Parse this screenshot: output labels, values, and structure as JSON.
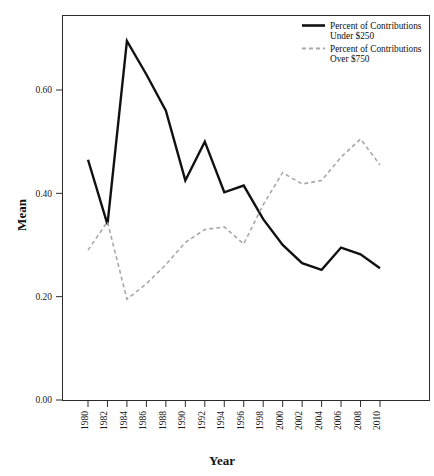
{
  "chart_data": {
    "type": "line",
    "title": "",
    "xlabel": "Year",
    "ylabel": "Mean",
    "x": [
      1980,
      1982,
      1984,
      1986,
      1988,
      1990,
      1992,
      1994,
      1996,
      1998,
      2000,
      2002,
      2004,
      2006,
      2008,
      2010
    ],
    "categories": [
      "1980",
      "1982",
      "1984",
      "1986",
      "1988",
      "1990",
      "1992",
      "1994",
      "1996",
      "1998",
      "2000",
      "2002",
      "2004",
      "2006",
      "2008",
      "2010"
    ],
    "xlim": [
      1980,
      2010
    ],
    "ylim": [
      0.0,
      0.75
    ],
    "ytick_values": [
      0.0,
      0.2,
      0.4,
      0.6
    ],
    "ytick_labels": [
      "0.00",
      "0.20",
      "0.40",
      "0.60"
    ],
    "grid": false,
    "legend_position": "top-right",
    "series": [
      {
        "name": "Percent of Contributions Under $250",
        "name_line1": "Percent of Contributions",
        "name_line2": "Under $250",
        "style": "solid",
        "color": "#111111",
        "width": 2.4,
        "values": [
          0.465,
          0.34,
          0.695,
          0.63,
          0.56,
          0.425,
          0.5,
          0.402,
          0.415,
          0.35,
          0.3,
          0.265,
          0.252,
          0.295,
          0.282,
          0.255
        ]
      },
      {
        "name": "Percent of Contributions Over $750",
        "name_line1": "Percent of Contributions",
        "name_line2": "Over $750",
        "style": "dashed",
        "color": "#a8a8a8",
        "width": 1.6,
        "values": [
          0.29,
          0.345,
          0.195,
          0.225,
          0.262,
          0.305,
          0.33,
          0.335,
          0.302,
          0.378,
          0.44,
          0.418,
          0.425,
          0.47,
          0.505,
          0.455
        ]
      }
    ]
  },
  "axes": {
    "y_title": "Mean",
    "x_title": "Year"
  },
  "legend": {
    "items": [
      {
        "label_line1": "Percent of Contributions",
        "label_line2": "Under $250",
        "swatch": "solid-line-swatch"
      },
      {
        "label_line1": "Percent of Contributions",
        "label_line2": "Over $750",
        "swatch": "dashed-line-swatch"
      }
    ]
  },
  "colors": {
    "series_under": "#111111",
    "series_over": "#a8a8a8",
    "frame": "#2b2b2b",
    "background": "#ffffff"
  }
}
